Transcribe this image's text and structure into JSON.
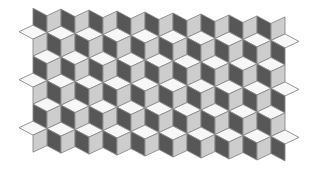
{
  "colors": {
    "background": "#ffffff",
    "top_face": "#f7f7f7",
    "left_face": "#575757",
    "right_face": "#cdcdcd",
    "stroke": "#8a8a8a"
  },
  "geometry": {
    "half_width": 14,
    "top_rise": 7,
    "side_height": 17,
    "row_pitch": 24,
    "col_pitch": 28,
    "origin_x": 47,
    "origin_y": 0,
    "skew_y_deg": 2
  },
  "rows": [
    {
      "index": 0,
      "offset": 0,
      "columns": 9,
      "show_tops": false,
      "left_flank": false,
      "right_flank": false
    },
    {
      "index": 1,
      "offset": 14,
      "columns": 8,
      "show_tops": true,
      "left_flank": true,
      "right_flank": true
    },
    {
      "index": 2,
      "offset": 0,
      "columns": 9,
      "show_tops": true,
      "left_flank": false,
      "right_flank": false
    },
    {
      "index": 3,
      "offset": 14,
      "columns": 8,
      "show_tops": true,
      "left_flank": true,
      "right_flank": true
    },
    {
      "index": 4,
      "offset": 0,
      "columns": 9,
      "show_tops": true,
      "left_flank": false,
      "right_flank": false
    },
    {
      "index": 5,
      "offset": 14,
      "columns": 8,
      "show_tops": true,
      "left_flank": true,
      "right_flank": true
    }
  ]
}
